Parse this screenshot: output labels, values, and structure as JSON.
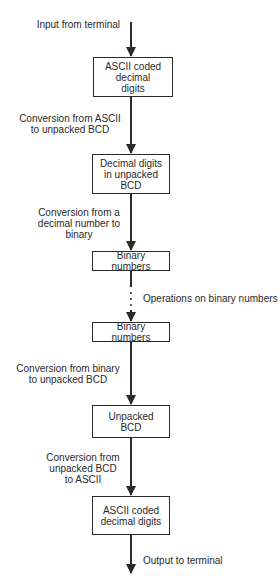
{
  "diagram": {
    "type": "flowchart",
    "direction": "top-to-bottom",
    "nodes": [
      {
        "id": "ascii_in",
        "label": "ASCII coded\ndecimal\ndigits"
      },
      {
        "id": "bcd_in",
        "label": "Decimal digits\nin unpacked\nBCD"
      },
      {
        "id": "binary_1",
        "label": "Binary numbers"
      },
      {
        "id": "binary_2",
        "label": "Binary numbers"
      },
      {
        "id": "bcd_out",
        "label": "Unpacked\nBCD"
      },
      {
        "id": "ascii_out",
        "label": "ASCII coded\ndecimal digits"
      }
    ],
    "edges": [
      {
        "from": "input",
        "to": "ascii_in",
        "label": "Input from terminal"
      },
      {
        "from": "ascii_in",
        "to": "bcd_in",
        "label": "Conversion from ASCII\nto unpacked BCD"
      },
      {
        "from": "bcd_in",
        "to": "binary_1",
        "label": "Conversion from a\ndecimal number to\nbinary"
      },
      {
        "from": "binary_1",
        "to": "binary_2",
        "label": "Operations on binary numbers",
        "style": "dotted"
      },
      {
        "from": "binary_2",
        "to": "bcd_out",
        "label": "Conversion from binary\nto unpacked BCD"
      },
      {
        "from": "bcd_out",
        "to": "ascii_out",
        "label": "Conversion from\nunpacked BCD\nto ASCII"
      },
      {
        "from": "ascii_out",
        "to": "output",
        "label": "Output to terminal"
      }
    ]
  },
  "colors": {
    "line": "#2a2a2a",
    "background": "#ffffff"
  }
}
